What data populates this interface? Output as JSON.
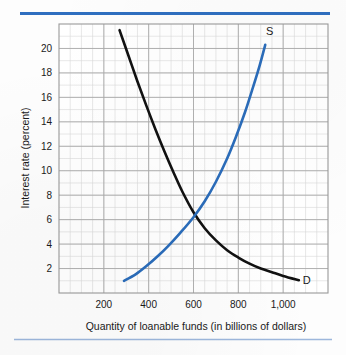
{
  "figure": {
    "background_color": "#fdfdfd",
    "rule_color_top": "#2f6fc0",
    "rule_color_bottom": "#9db7dc",
    "plot_border_color": "#9a9a9a",
    "grid_minor_color": "#d8d8d8",
    "grid_major_color": "#aaaaaa"
  },
  "chart_data": {
    "type": "line",
    "title": "",
    "xlabel": "Quantity of loanable funds (in billions of dollars)",
    "ylabel": "Interest rate (percent)",
    "xlim": [
      0,
      1200
    ],
    "ylim": [
      0,
      22
    ],
    "xticks": [
      200,
      400,
      600,
      800,
      1000
    ],
    "xtick_labels": [
      "200",
      "400",
      "600",
      "800",
      "1,000"
    ],
    "yticks": [
      2,
      4,
      6,
      8,
      10,
      12,
      14,
      16,
      18,
      20
    ],
    "ytick_labels": [
      "2",
      "4",
      "6",
      "8",
      "10",
      "12",
      "14",
      "16",
      "18",
      "20"
    ],
    "grid": true,
    "grid_minor_step_x": 50,
    "grid_minor_step_y": 1,
    "grid_major_step_x": 200,
    "grid_major_step_y": 2,
    "legend": "none",
    "annotations": [
      {
        "name": "supply-label",
        "text": "S",
        "x": 940,
        "y": 21.4
      },
      {
        "name": "demand-label",
        "text": "D",
        "x": 1105,
        "y": 1.1
      }
    ],
    "equilibrium": {
      "x": 600,
      "y": 6
    },
    "series": [
      {
        "name": "Demand",
        "label": "D",
        "color": "#111111",
        "width": 2.6,
        "points": [
          {
            "x": 270,
            "y": 21.5
          },
          {
            "x": 310,
            "y": 19.4
          },
          {
            "x": 350,
            "y": 17.3
          },
          {
            "x": 390,
            "y": 15.3
          },
          {
            "x": 430,
            "y": 13.4
          },
          {
            "x": 470,
            "y": 11.6
          },
          {
            "x": 510,
            "y": 9.9
          },
          {
            "x": 550,
            "y": 8.3
          },
          {
            "x": 600,
            "y": 6.6
          },
          {
            "x": 650,
            "y": 5.3
          },
          {
            "x": 700,
            "y": 4.3
          },
          {
            "x": 750,
            "y": 3.5
          },
          {
            "x": 800,
            "y": 2.9
          },
          {
            "x": 850,
            "y": 2.4
          },
          {
            "x": 900,
            "y": 2.0
          },
          {
            "x": 950,
            "y": 1.7
          },
          {
            "x": 1000,
            "y": 1.4
          },
          {
            "x": 1070,
            "y": 1.05
          }
        ]
      },
      {
        "name": "Supply",
        "label": "S",
        "color": "#2a6cba",
        "width": 2.6,
        "points": [
          {
            "x": 290,
            "y": 1.0
          },
          {
            "x": 340,
            "y": 1.5
          },
          {
            "x": 390,
            "y": 2.2
          },
          {
            "x": 440,
            "y": 3.0
          },
          {
            "x": 490,
            "y": 3.9
          },
          {
            "x": 540,
            "y": 4.9
          },
          {
            "x": 600,
            "y": 6.2
          },
          {
            "x": 650,
            "y": 7.5
          },
          {
            "x": 700,
            "y": 9.1
          },
          {
            "x": 750,
            "y": 11.0
          },
          {
            "x": 790,
            "y": 12.8
          },
          {
            "x": 830,
            "y": 14.8
          },
          {
            "x": 865,
            "y": 16.8
          },
          {
            "x": 895,
            "y": 18.6
          },
          {
            "x": 920,
            "y": 20.3
          }
        ]
      }
    ]
  }
}
